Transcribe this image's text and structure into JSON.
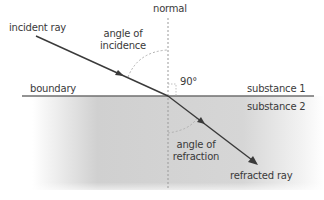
{
  "diagram": {
    "labels": {
      "normal": "normal",
      "incident_ray": "incident ray",
      "angle_of_incidence_line1": "angle of",
      "angle_of_incidence_line2": "incidence",
      "right_angle": "90°",
      "boundary": "boundary",
      "substance_1": "substance 1",
      "substance_2": "substance 2",
      "angle_of_refraction_line1": "angle of",
      "angle_of_refraction_line2": "refraction",
      "refracted_ray": "refracted ray"
    },
    "colors": {
      "ray": "#3a3a3a",
      "boundary_line": "#6a6a6a",
      "normal_line": "#9a9a9a",
      "angle_arc": "#a8a8a8",
      "substance_2_fill": "#c9c9c9",
      "text": "#3a3a3a"
    }
  }
}
